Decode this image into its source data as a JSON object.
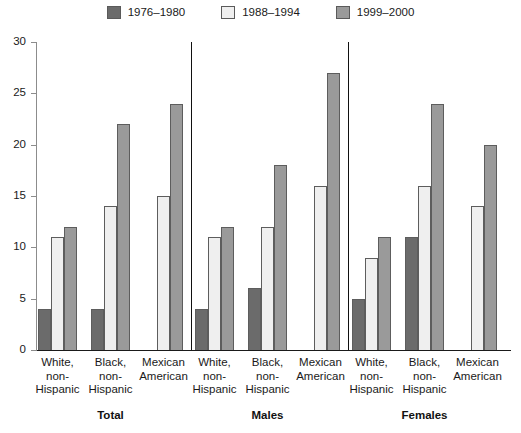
{
  "legend": {
    "position": "top-center",
    "items": [
      {
        "label": "1976–1980",
        "color": "#6b6b6b"
      },
      {
        "label": "1988–1994",
        "color": "#efefef"
      },
      {
        "label": "1999–2000",
        "color": "#9a9a9a"
      }
    ]
  },
  "axis": {
    "y_ticks": [
      "0",
      "5",
      "10",
      "15",
      "20",
      "25",
      "30"
    ],
    "y_min": 0,
    "y_max": 30
  },
  "groups": [
    {
      "label": "Total",
      "categories": [
        {
          "lines": [
            "White,",
            "non-",
            "Hispanic"
          ]
        },
        {
          "lines": [
            "Black,",
            "non-",
            "Hispanic"
          ]
        },
        {
          "lines": [
            "Mexican",
            "American"
          ]
        }
      ]
    },
    {
      "label": "Males",
      "categories": [
        {
          "lines": [
            "White,",
            "non-",
            "Hispanic"
          ]
        },
        {
          "lines": [
            "Black,",
            "non-",
            "Hispanic"
          ]
        },
        {
          "lines": [
            "Mexican",
            "American"
          ]
        }
      ]
    },
    {
      "label": "Females",
      "categories": [
        {
          "lines": [
            "White,",
            "non-",
            "Hispanic"
          ]
        },
        {
          "lines": [
            "Black,",
            "non-",
            "Hispanic"
          ]
        },
        {
          "lines": [
            "Mexican",
            "American"
          ]
        }
      ]
    }
  ],
  "chart_data": {
    "type": "bar",
    "title": "",
    "xlabel": "",
    "ylabel": "",
    "ylim": [
      0,
      30
    ],
    "grid": false,
    "legend_position": "top-center",
    "group_labels": [
      "Total",
      "Males",
      "Females"
    ],
    "categories": [
      "Total – White, non-Hispanic",
      "Total – Black, non-Hispanic",
      "Total – Mexican American",
      "Males – White, non-Hispanic",
      "Males – Black, non-Hispanic",
      "Males – Mexican American",
      "Females – White, non-Hispanic",
      "Females – Black, non-Hispanic",
      "Females – Mexican American"
    ],
    "series": [
      {
        "name": "1976–1980",
        "color": "#6b6b6b",
        "values": [
          4,
          4,
          null,
          4,
          6,
          null,
          5,
          11,
          null
        ]
      },
      {
        "name": "1988–1994",
        "color": "#efefef",
        "values": [
          11,
          14,
          15,
          11,
          12,
          16,
          9,
          16,
          14
        ]
      },
      {
        "name": "1999–2000",
        "color": "#9a9a9a",
        "values": [
          12,
          22,
          24,
          12,
          18,
          27,
          11,
          24,
          20
        ]
      }
    ]
  }
}
